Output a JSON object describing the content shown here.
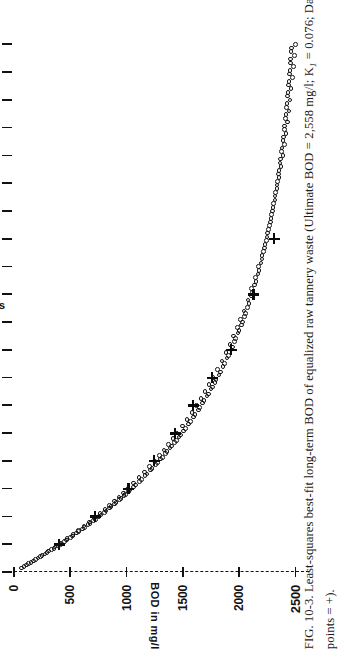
{
  "figure": {
    "caption_line1": "FIG. 10-3.  Least-squares best-fit long-term BOD of equalized raw tannery waste (Ultimate BOD = 2,558 mg/l; K",
    "caption_sub": "1",
    "caption_line1b": " = 0.076; Data",
    "caption_line2": "points = +).",
    "caption_full": "FIG. 10-3. Least-squares best-fit long-term BOD of equalized raw tannery waste (Ultimate BOD = 2,558 mg/l; K1 = 0.076; Data points = +).",
    "figure_number": "FIG. 10-3."
  },
  "chart_data": {
    "type": "scatter",
    "title": "",
    "xlabel": "Time in doys",
    "ylabel": "BOD in mg/l",
    "xlim": [
      0,
      19.3
    ],
    "ylim": [
      0,
      2700
    ],
    "xticks": [
      0,
      2,
      4,
      6,
      8,
      10,
      12,
      14,
      16,
      18
    ],
    "xtick_labels": [
      "0",
      "2",
      "4",
      "6",
      "8",
      "10",
      "12",
      "14",
      "16",
      "18"
    ],
    "xminor_ticks": [
      1,
      3,
      5,
      7,
      9,
      11,
      13,
      15,
      17,
      19
    ],
    "yticks": [
      0,
      500,
      1000,
      1500,
      2000,
      2500
    ],
    "ytick_labels": [
      "0",
      "500",
      "1000",
      "1500",
      "2000",
      "2500"
    ],
    "grid": false,
    "legend": "none",
    "orientation": "rotated-90-ccw",
    "model": {
      "ultimate_bod": 2558,
      "ultimate_bod_label": "2,558 mg/l",
      "k1": 0.076,
      "k1_label": "0.076",
      "equation": "BOD(t) = 2558 * (1 - 10^(-0.076 t))"
    },
    "series": [
      {
        "name": "Least-squares best-fit curve",
        "marker": "o",
        "x": [
          0.15,
          0.3,
          0.45,
          0.6,
          0.75,
          0.9,
          1.05,
          1.2,
          1.35,
          1.5,
          1.65,
          1.8,
          1.95,
          2.1,
          2.25,
          2.4,
          2.55,
          2.7,
          2.85,
          3.0,
          3.2,
          3.4,
          3.6,
          3.8,
          4.0,
          4.2,
          4.4,
          4.6,
          4.8,
          5.0,
          5.25,
          5.5,
          5.75,
          6.0,
          6.25,
          6.5,
          6.75,
          7.0,
          7.3,
          7.6,
          7.9,
          8.2,
          8.5,
          8.8,
          9.1,
          9.4,
          9.8,
          10.2,
          10.6,
          11.0,
          11.4,
          11.8,
          12.2,
          12.6,
          13.0,
          13.4,
          13.8,
          14.2,
          14.6,
          15.0,
          15.4,
          15.8,
          16.2,
          16.6,
          17.0,
          17.4,
          17.8,
          18.2,
          18.6,
          19.0
        ],
        "y": [
          65,
          128,
          189,
          249,
          307,
          363,
          418,
          471,
          523,
          574,
          623,
          671,
          717,
          763,
          807,
          850,
          892,
          933,
          972,
          1011,
          1061,
          1110,
          1157,
          1203,
          1247,
          1290,
          1331,
          1372,
          1411,
          1449,
          1495,
          1538,
          1580,
          1621,
          1660,
          1697,
          1733,
          1768,
          1808,
          1846,
          1883,
          1918,
          1951,
          1983,
          2013,
          2042,
          2078,
          2112,
          2144,
          2174,
          2202,
          2228,
          2253,
          2276,
          2298,
          2318,
          2337,
          2355,
          2372,
          2388,
          2402,
          2416,
          2429,
          2441,
          2452,
          2462,
          2472,
          2481,
          2490,
          2498
        ]
      },
      {
        "name": "Data points",
        "marker": "+",
        "x": [
          1.0,
          2.0,
          3.0,
          4.0,
          5.0,
          6.0,
          7.0,
          8.0,
          10.0,
          12.0
        ],
        "y": [
          400,
          720,
          1020,
          1245,
          1430,
          1590,
          1760,
          1930,
          2130,
          2310
        ]
      }
    ]
  }
}
